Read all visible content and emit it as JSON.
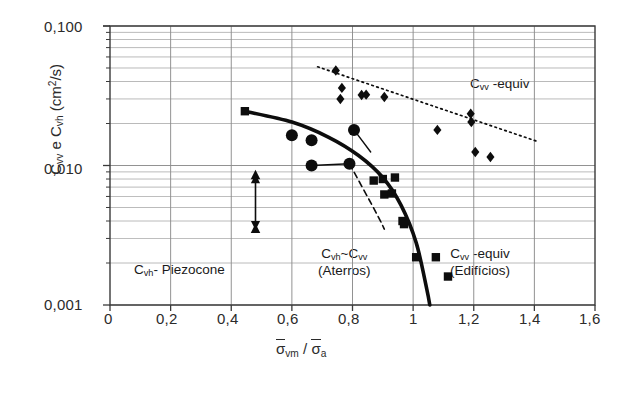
{
  "figure": {
    "background": "#ffffff",
    "axis_color": "#3a3a3a",
    "grid_color": "#8d8d8d",
    "marker_color": "#0d0d0d"
  },
  "axes": {
    "y_title_prefix": "C",
    "y_title": "C_vv e C_vh (cm2/s)",
    "y_parts": {
      "c1": "C",
      "s1": "vv",
      "mid": " e ",
      "c2": "C",
      "s2": "vh",
      "unit_open": " (cm",
      "unit_sup": "2",
      "unit_close": "/s)"
    },
    "x_title": "σ̄vm / σ̄a",
    "x_parts": {
      "sig1": "σ",
      "sub1": "vm",
      "slash": " / ",
      "sig2": "σ",
      "sub2": "a"
    },
    "y_tick_labels": [
      "0,100",
      "0,010",
      "0,001"
    ],
    "x_tick_labels": [
      "0",
      "0,2",
      "0,4",
      "0,6",
      "0,8",
      "1",
      "1,2",
      "1,4",
      "1,6"
    ]
  },
  "annotations": [
    {
      "name": "cvv-equiv-top",
      "line1_c": "C",
      "line1_sub": "vv",
      "line1_tail": " -equiv",
      "line2": ""
    },
    {
      "name": "cvh-piezocone",
      "line1_c": "C",
      "line1_sub": "vh",
      "line1_tail": "- Piezocone",
      "line2": ""
    },
    {
      "name": "cvh-cvv-aterros",
      "line1_c": "C",
      "line1_sub": "vh",
      "line1_tail": "~C",
      "line1_sub2": "vv",
      "line2": "(Aterros)"
    },
    {
      "name": "cvv-equiv-edificios",
      "line1_c": "C",
      "line1_sub": "vv",
      "line1_tail": " -equiv",
      "line2": "(Edifícios)"
    }
  ],
  "chart_data": {
    "type": "scatter",
    "title": "",
    "xlabel": "σ̄vm / σ̄a",
    "ylabel": "Cvv e Cvh (cm2/s)",
    "xlim": [
      0,
      1.6
    ],
    "ylim": [
      0.001,
      0.1
    ],
    "yscale": "log",
    "xscale": "linear",
    "grid": true,
    "grid_style": "log-minor horizontal + major vertical",
    "legend": "inline annotations",
    "series": [
      {
        "name": "Cvv-equiv (diamonds)",
        "marker": "diamond",
        "color": "#0d0d0d",
        "points": [
          [
            0.745,
            0.048
          ],
          [
            0.765,
            0.036
          ],
          [
            0.76,
            0.03
          ],
          [
            0.83,
            0.032
          ],
          [
            0.845,
            0.0322
          ],
          [
            0.905,
            0.031
          ],
          [
            1.19,
            0.0235
          ],
          [
            1.192,
            0.0205
          ],
          [
            1.08,
            0.018
          ],
          [
            1.205,
            0.0125
          ],
          [
            1.255,
            0.0115
          ]
        ]
      },
      {
        "name": "Cvh~Cvv Aterros (circles)",
        "marker": "circle",
        "color": "#0d0d0d",
        "points": [
          [
            0.6,
            0.0165
          ],
          [
            0.665,
            0.0152
          ],
          [
            0.665,
            0.01
          ],
          [
            0.79,
            0.0103
          ],
          [
            0.805,
            0.018
          ]
        ]
      },
      {
        "name": "Cvv-equiv Edificios (squares)",
        "marker": "square",
        "color": "#0d0d0d",
        "points": [
          [
            0.445,
            0.0245
          ],
          [
            0.87,
            0.0078
          ],
          [
            0.9,
            0.008
          ],
          [
            0.94,
            0.0082
          ],
          [
            0.905,
            0.0062
          ],
          [
            0.93,
            0.0063
          ],
          [
            0.965,
            0.004
          ],
          [
            0.97,
            0.0038
          ],
          [
            1.01,
            0.0022
          ],
          [
            1.075,
            0.0022
          ],
          [
            1.115,
            0.0016
          ]
        ]
      },
      {
        "name": "Cvh-Piezocone (triangles)",
        "marker": "triangle",
        "color": "#0d0d0d",
        "points": [
          [
            0.48,
            0.0085
          ],
          [
            0.48,
            0.0035
          ]
        ]
      }
    ],
    "lines": [
      {
        "name": "dotted-trend-cvv-equiv",
        "style": "dotted",
        "points": [
          [
            0.685,
            0.051
          ],
          [
            1.405,
            0.015
          ]
        ]
      },
      {
        "name": "thick-design-curve",
        "style": "solid-thick",
        "points": [
          [
            0.445,
            0.0245
          ],
          [
            0.6,
            0.0205
          ],
          [
            0.72,
            0.016
          ],
          [
            0.82,
            0.0118
          ],
          [
            0.9,
            0.0082
          ],
          [
            0.96,
            0.0052
          ],
          [
            1.01,
            0.0028
          ],
          [
            1.045,
            0.0013
          ],
          [
            1.055,
            0.001
          ]
        ]
      },
      {
        "name": "thin-connector-upper",
        "style": "solid-thin",
        "points": [
          [
            0.805,
            0.018
          ],
          [
            0.86,
            0.0125
          ]
        ]
      },
      {
        "name": "thin-connector-lower",
        "style": "solid-thin",
        "points": [
          [
            0.665,
            0.01
          ],
          [
            0.79,
            0.0103
          ]
        ]
      },
      {
        "name": "dashed-branch",
        "style": "dashed",
        "points": [
          [
            0.79,
            0.0103
          ],
          [
            0.88,
            0.0045
          ],
          [
            0.905,
            0.0035
          ]
        ]
      }
    ],
    "arrows": [
      {
        "name": "piezocone-range-arrow",
        "x": 0.48,
        "y_top": 0.0085,
        "y_bottom": 0.0035,
        "double_headed": true
      }
    ]
  }
}
